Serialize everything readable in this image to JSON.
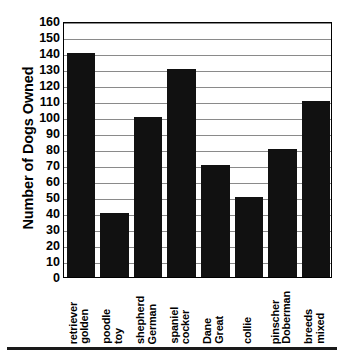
{
  "chart_data": {
    "type": "bar",
    "title": "",
    "xlabel": "",
    "ylabel": "Number of Dogs Owned",
    "categories": [
      "golden retriever",
      "toy poodle",
      "German shepherd",
      "cocker spaniel",
      "Great Dane",
      "collie",
      "Doberman pinscher",
      "mixed breeds"
    ],
    "category_words": [
      [
        "golden",
        "retriever"
      ],
      [
        "toy",
        "poodle"
      ],
      [
        "German",
        "shepherd"
      ],
      [
        "cocker",
        "spaniel"
      ],
      [
        "Great",
        "Dane"
      ],
      [
        "collie"
      ],
      [
        "Doberman",
        "pinscher"
      ],
      [
        "mixed",
        "breeds"
      ]
    ],
    "values": [
      140,
      40,
      100,
      130,
      70,
      50,
      80,
      110
    ],
    "ylim": [
      0,
      160
    ],
    "ytick_step": 10,
    "yticks": [
      0,
      10,
      20,
      30,
      40,
      50,
      60,
      70,
      80,
      90,
      100,
      110,
      120,
      130,
      140,
      150,
      160
    ],
    "grid": true,
    "legend": "none",
    "bar_color": "#111111",
    "grid_color": "#8a8a8a",
    "frame_color": "#000000",
    "background_color": "#ffffff"
  }
}
